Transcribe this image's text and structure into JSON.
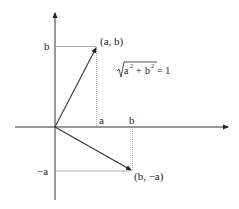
{
  "diagram": {
    "formula": {
      "radicand_a": "a",
      "radicand_b": "b",
      "exp": "2",
      "plus": "+",
      "equals": "= 1"
    },
    "points": {
      "p1_label": "(a, b)",
      "p2_label": "(b, −a)"
    },
    "axis_labels": {
      "y_b": "b",
      "y_neg_a": "−a",
      "x_a": "a",
      "x_b": "b"
    },
    "colors": {
      "axis": "#333333",
      "vector": "#333333",
      "guide": "#888888"
    }
  }
}
